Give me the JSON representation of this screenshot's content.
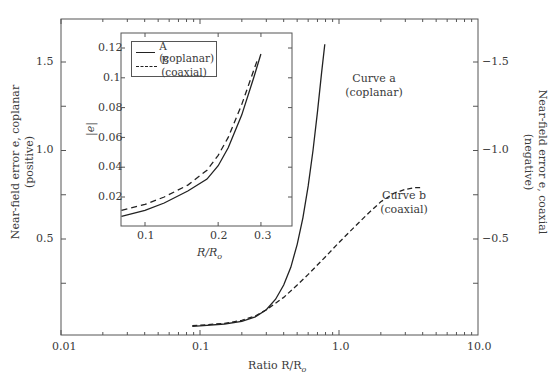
{
  "chart_data": [
    {
      "type": "line",
      "title": "",
      "xlabel": "Ratio R/R_o",
      "ylabel_left": "Near-field error e, coplanar (positive)",
      "ylabel_right": "Near-field error e, coaxial (negative)",
      "xscale": "log",
      "xlim": [
        0.01,
        10.0
      ],
      "ylim_left": [
        0,
        1.7
      ],
      "ylim_right": [
        0,
        -1.7
      ],
      "xticks": [
        "0.01",
        "0.1",
        "1.0",
        "10.0"
      ],
      "yticks_left": [
        "0.5",
        "1.0",
        "1.5"
      ],
      "yticks_right": [
        "-0.5",
        "-1.0",
        "-1.5"
      ],
      "grid": false,
      "annotations": [
        {
          "text": "Curve a",
          "sub": "(coplanar)"
        },
        {
          "text": "Curve b",
          "sub": "(coaxial)"
        }
      ],
      "series": [
        {
          "name": "Curve a (coplanar)",
          "style": "solid",
          "x": [
            0.088,
            0.1,
            0.15,
            0.2,
            0.25,
            0.3,
            0.35,
            0.4,
            0.45,
            0.5,
            0.55,
            0.6,
            0.65,
            0.7,
            0.75,
            0.79
          ],
          "y": [
            0.006,
            0.009,
            0.02,
            0.035,
            0.06,
            0.1,
            0.16,
            0.24,
            0.34,
            0.47,
            0.62,
            0.8,
            1.0,
            1.22,
            1.44,
            1.6
          ]
        },
        {
          "name": "Curve b (coaxial)",
          "style": "dashed",
          "x": [
            0.088,
            0.1,
            0.15,
            0.2,
            0.25,
            0.3,
            0.4,
            0.5,
            0.6,
            0.8,
            1.0,
            1.3,
            1.6,
            2.0,
            2.5,
            3.0,
            3.5,
            3.9
          ],
          "y": [
            0.011,
            0.013,
            0.023,
            0.04,
            0.065,
            0.1,
            0.17,
            0.24,
            0.3,
            0.4,
            0.48,
            0.57,
            0.64,
            0.71,
            0.76,
            0.78,
            0.79,
            0.79
          ]
        }
      ]
    },
    {
      "type": "line",
      "title": "",
      "inset": true,
      "xlabel": "R/R_o",
      "ylabel": "|e|",
      "xscale": "log",
      "xlim": [
        0.075,
        0.35
      ],
      "ylim": [
        0,
        0.13
      ],
      "xticks": [
        "0.1",
        "0.2",
        "0.3"
      ],
      "yticks": [
        "0.02",
        "0.04",
        "0.06",
        "0.08",
        "0.1",
        "0.12"
      ],
      "legend": {
        "position": "upper left",
        "entries": [
          "A (coplanar)",
          "B (coaxial)"
        ]
      },
      "series": [
        {
          "name": "A (coplanar)",
          "style": "solid",
          "x": [
            0.08,
            0.1,
            0.12,
            0.15,
            0.18,
            0.2,
            0.22,
            0.25,
            0.28,
            0.3
          ],
          "y": [
            0.007,
            0.011,
            0.016,
            0.024,
            0.032,
            0.041,
            0.053,
            0.075,
            0.1,
            0.116
          ]
        },
        {
          "name": "B (coaxial)",
          "style": "dashed",
          "x": [
            0.08,
            0.1,
            0.12,
            0.15,
            0.18,
            0.2,
            0.22,
            0.25,
            0.28,
            0.29
          ],
          "y": [
            0.011,
            0.015,
            0.02,
            0.028,
            0.038,
            0.048,
            0.06,
            0.082,
            0.105,
            0.112
          ]
        }
      ]
    }
  ],
  "labels": {
    "xlabel_main": "Ratio R/R",
    "xlabel_main_sub": "o",
    "ylabel_left_line1": "Near-field error e, coplanar",
    "ylabel_left_line2": "(positive)",
    "ylabel_right_line1": "Near-field error e, coaxial",
    "ylabel_right_line2": "(negative)",
    "curve_a": "Curve a",
    "curve_a_sub": "(coplanar)",
    "curve_b": "Curve b",
    "curve_b_sub": "(coaxial)",
    "inset_xlabel": "R/R",
    "inset_xlabel_sub": "o",
    "inset_ylabel": "|e|",
    "legend_a": "A (coplanar)",
    "legend_b": "B (coaxial)"
  },
  "ticks": {
    "x_main": [
      "0.01",
      "0.1",
      "1.0",
      "10.0"
    ],
    "y_left": [
      "1.5",
      "1.0",
      "0.5"
    ],
    "y_right": [
      "−1.5",
      "−1.0",
      "−0.5"
    ],
    "inset_y": [
      "0.12",
      "0.1",
      "0.08",
      "0.06",
      "0.04",
      "0.02"
    ],
    "inset_x": [
      "0.1",
      "0.2",
      "0.3"
    ]
  }
}
